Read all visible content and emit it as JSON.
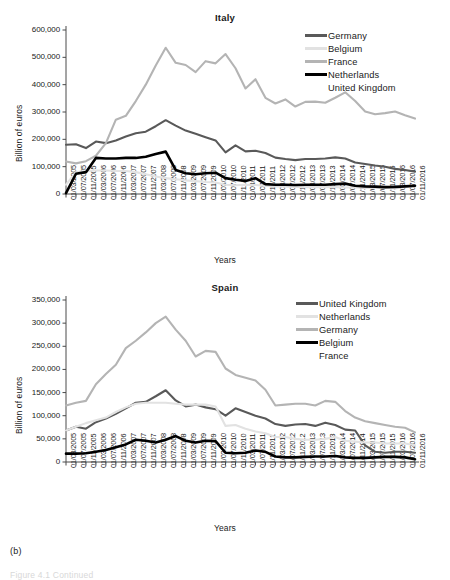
{
  "figure": {
    "caption": "(b)",
    "caption_faint": "Figure 4.1  Continued"
  },
  "chart_data": [
    {
      "id": "italy",
      "type": "line",
      "title": "Italy",
      "xlabel": "Years",
      "ylabel": "Billion of euros",
      "ylim": [
        0,
        600000
      ],
      "yticks": [
        0,
        100000,
        200000,
        300000,
        400000,
        500000,
        600000
      ],
      "ytick_labels": [
        "0",
        "100,000",
        "200,000",
        "300,000",
        "400,000",
        "500,000",
        "600,000"
      ],
      "grid": false,
      "legend_position": "top-right",
      "x": [
        "01/03/2005",
        "01/07/2005",
        "01/11/2005",
        "01/03/2006",
        "01/07/2006",
        "01/11/2006",
        "01/03/2007",
        "01/07/2007",
        "01/11/2007",
        "01/03/2008",
        "01/07/2008",
        "01/11/2008",
        "01/03/2009",
        "01/07/2009",
        "01/11/2009",
        "01/03/2010",
        "01/07/2010",
        "01/11/2010",
        "01/03/2011",
        "01/07/2011",
        "01/11/2011",
        "01/03/2012",
        "01/07/2012",
        "01/11/2012",
        "01/03/2013",
        "01/07/2013",
        "01/11/2013",
        "01/03/2014",
        "01/07/2014",
        "01/11/2014",
        "01/03/2015",
        "01/07/2015",
        "01/11/2015",
        "01/03/2016",
        "01/07/2016",
        "01/11/2016"
      ],
      "series": [
        {
          "name": "Germany",
          "color": "#595959",
          "width": 2.1,
          "values": [
            180000,
            182000,
            168000,
            192000,
            186000,
            196000,
            210000,
            222000,
            228000,
            248000,
            270000,
            250000,
            232000,
            220000,
            208000,
            196000,
            152000,
            178000,
            156000,
            158000,
            150000,
            133000,
            128000,
            124000,
            128000,
            128000,
            130000,
            134000,
            130000,
            115000,
            110000,
            104000,
            100000,
            92000,
            88000,
            82000
          ]
        },
        {
          "name": "Belgium",
          "color": "#e2e2e2",
          "width": 2.1,
          "values": [
            34000,
            80000,
            84000,
            86000,
            86000,
            84000,
            84000,
            80000,
            72000,
            64000,
            58000,
            54000,
            50000,
            47000,
            44000,
            42000,
            34000,
            32000,
            34000,
            33000,
            30000,
            28000,
            27000,
            26000,
            25000,
            25000,
            25000,
            25000,
            24000,
            24000,
            22000,
            22000,
            22000,
            20000,
            26000,
            28000
          ]
        },
        {
          "name": "France",
          "color": "#b4b4b4",
          "width": 2.1,
          "values": [
            119000,
            112000,
            120000,
            140000,
            186000,
            272000,
            286000,
            340000,
            400000,
            470000,
            535000,
            480000,
            472000,
            446000,
            486000,
            478000,
            512000,
            460000,
            386000,
            420000,
            352000,
            331000,
            346000,
            320000,
            337000,
            338000,
            334000,
            352000,
            372000,
            340000,
            302000,
            292000,
            296000,
            302000,
            288000,
            276000
          ]
        },
        {
          "name": "Netherlands",
          "color": "#000000",
          "width": 2.6,
          "values": [
            3000,
            74000,
            80000,
            132000,
            130000,
            130000,
            132000,
            132000,
            136000,
            146000,
            155000,
            88000,
            76000,
            72000,
            76000,
            78000,
            58000,
            52000,
            48000,
            58000,
            36000,
            34000,
            34000,
            33000,
            34000,
            34000,
            34000,
            36000,
            38000,
            30000,
            28000,
            27000,
            25000,
            26000,
            28000,
            30000
          ]
        },
        {
          "name": "United Kingdom",
          "color": "#ffffff",
          "width": 2.1,
          "values": [
            null,
            null,
            null,
            null,
            null,
            null,
            null,
            null,
            null,
            null,
            null,
            null,
            null,
            null,
            null,
            null,
            null,
            null,
            null,
            null,
            null,
            null,
            null,
            null,
            null,
            null,
            null,
            null,
            null,
            null,
            null,
            null,
            null,
            null,
            null,
            null
          ]
        }
      ]
    },
    {
      "id": "spain",
      "type": "line",
      "title": "Spain",
      "xlabel": "Years",
      "ylabel": "Billion of euros",
      "ylim": [
        0,
        350000
      ],
      "yticks": [
        0,
        50000,
        100000,
        150000,
        200000,
        250000,
        300000,
        350000
      ],
      "ytick_labels": [
        "0",
        "50,000",
        "100,000",
        "150,000",
        "200,000",
        "250,000",
        "300,000",
        "350,000"
      ],
      "grid": false,
      "legend_position": "top-right",
      "x": [
        "01/03/2005",
        "01/07/2005",
        "01/11/2005",
        "01/03/2006",
        "01/07/2006",
        "01/11/2006",
        "01/03/2007",
        "01/07/2007",
        "01/11/2007",
        "01/03/2008",
        "01/07/2008",
        "01/11/2008",
        "01/03/2009",
        "01/07/2009",
        "01/11/2009",
        "01/03/2010",
        "01/07/2010",
        "01/11/2010",
        "01/03/2011",
        "01/07/2011",
        "01/11/2011",
        "01/03/2012",
        "01/07/2012",
        "01/11/2012",
        "01/03/2013",
        "01/07/2013",
        "01/11/2013",
        "01/03/2014",
        "01/07/2014",
        "01/11/2014",
        "01/03/2015",
        "01/07/2015",
        "01/11/2015",
        "01/03/2016",
        "01/07/2016",
        "01/11/2016"
      ],
      "series": [
        {
          "name": "United Kingdom",
          "color": "#595959",
          "width": 2.1,
          "values": [
            68000,
            76000,
            72000,
            86000,
            94000,
            104000,
            116000,
            128000,
            130000,
            142000,
            155000,
            133000,
            120000,
            124000,
            118000,
            114000,
            100000,
            116000,
            108000,
            100000,
            94000,
            82000,
            78000,
            81000,
            82000,
            78000,
            85000,
            80000,
            70000,
            68000,
            36000,
            22000,
            20000,
            22000,
            22000,
            20000
          ]
        },
        {
          "name": "Netherlands",
          "color": "#e2e2e2",
          "width": 2.1,
          "values": [
            68000,
            76000,
            84000,
            90000,
            96000,
            108000,
            118000,
            126000,
            128000,
            128000,
            128000,
            126000,
            124000,
            124000,
            124000,
            120000,
            78000,
            80000,
            72000,
            66000,
            62000,
            54000,
            54000,
            50000,
            48000,
            48000,
            50000,
            54000,
            46000,
            44000,
            42000,
            42000,
            40000,
            40000,
            40000,
            36000
          ]
        },
        {
          "name": "Germany",
          "color": "#b4b4b4",
          "width": 2.1,
          "values": [
            122000,
            128000,
            132000,
            168000,
            190000,
            210000,
            246000,
            262000,
            280000,
            300000,
            314000,
            286000,
            262000,
            228000,
            240000,
            238000,
            202000,
            188000,
            182000,
            176000,
            156000,
            122000,
            124000,
            126000,
            126000,
            122000,
            132000,
            130000,
            110000,
            96000,
            88000,
            84000,
            80000,
            76000,
            74000,
            64000
          ]
        },
        {
          "name": "Belgium",
          "color": "#000000",
          "width": 2.6,
          "values": [
            18000,
            18000,
            19000,
            22000,
            26000,
            32000,
            38000,
            48000,
            46000,
            42000,
            48000,
            56000,
            46000,
            42000,
            46000,
            45000,
            20000,
            19000,
            20000,
            25000,
            22000,
            12000,
            10000,
            10000,
            11000,
            12000,
            12000,
            13000,
            10000,
            9000,
            9000,
            10000,
            11000,
            11000,
            10000,
            6000
          ]
        },
        {
          "name": "France",
          "color": "#ffffff",
          "width": 2.1,
          "values": [
            null,
            null,
            null,
            null,
            null,
            null,
            null,
            null,
            null,
            null,
            null,
            null,
            null,
            null,
            null,
            null,
            null,
            null,
            null,
            null,
            null,
            null,
            null,
            null,
            null,
            null,
            null,
            null,
            null,
            null,
            null,
            null,
            null,
            null,
            null,
            null
          ]
        }
      ]
    }
  ]
}
